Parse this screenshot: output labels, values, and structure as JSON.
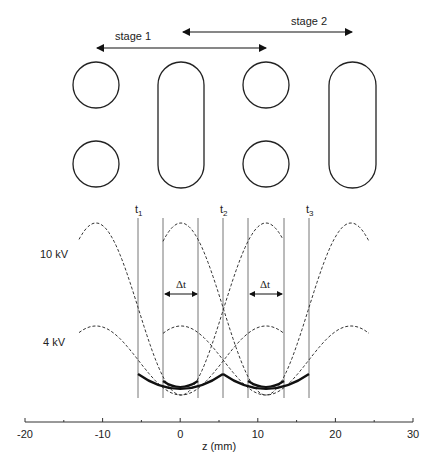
{
  "stages": [
    {
      "label": "stage 1",
      "arrow_x1": 97,
      "arrow_x2": 266,
      "arrow_y": 48,
      "label_x": 115,
      "label_y": 40
    },
    {
      "label": "stage 2",
      "arrow_x1": 183,
      "arrow_x2": 352,
      "arrow_y": 32,
      "label_x": 291,
      "label_y": 25
    }
  ],
  "electrodes": [
    {
      "type": "circle",
      "cx": 96,
      "cy": 85,
      "r": 23
    },
    {
      "type": "circle",
      "cx": 96,
      "cy": 164,
      "r": 23
    },
    {
      "type": "rod",
      "x": 158,
      "y": 62,
      "w": 46,
      "h": 126
    },
    {
      "type": "circle",
      "cx": 266,
      "cy": 85,
      "r": 23
    },
    {
      "type": "circle",
      "cx": 266,
      "cy": 164,
      "r": 23
    },
    {
      "type": "rod",
      "x": 329,
      "y": 62,
      "w": 47,
      "h": 126
    }
  ],
  "voltage_labels": [
    {
      "label": "10 kV",
      "x": 40,
      "y": 258
    },
    {
      "label": "4 kV",
      "x": 43,
      "y": 346
    }
  ],
  "time_markers": [
    {
      "label": "t",
      "sub": "1",
      "x": 138
    },
    {
      "label": "t",
      "sub": "2",
      "x": 223
    },
    {
      "label": "t",
      "sub": "3",
      "x": 309
    }
  ],
  "delta_t": [
    {
      "label": "Δt",
      "x1": 165,
      "x2": 197,
      "label_x": 181
    },
    {
      "label": "Δt",
      "x1": 250,
      "x2": 282,
      "label_x": 265
    }
  ],
  "vertical_lines_x": [
    138,
    163,
    198,
    223,
    248,
    284,
    309
  ],
  "axis": {
    "label": "z (mm)",
    "ticks": [
      "-20",
      "-10",
      "0",
      "10",
      "20",
      "30"
    ],
    "min": -20,
    "max": 30
  }
}
